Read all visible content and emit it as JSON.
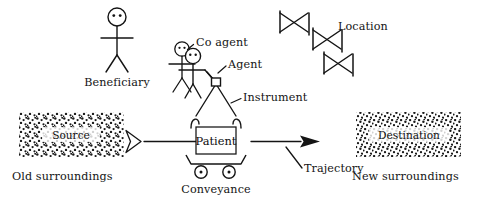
{
  "figure": {
    "background_color": "#ffffff",
    "ink_color": "#141414",
    "width": 477,
    "height": 203
  },
  "labels": {
    "beneficiary": "Beneficiary",
    "co_agent": "Co agent",
    "agent": "Agent",
    "instrument": "Instrument",
    "location": "Location",
    "source": "Source",
    "destination": "Destination",
    "patient": "Patient",
    "conveyance": "Conveyance",
    "trajectory": "Trajectory",
    "old_surroundings": "Old surroundings",
    "new_surroundings": "New surroundings"
  },
  "elements": {
    "beneficiary_figure": "stick-figure-icon",
    "co_agent_figure": "stick-figure-icon",
    "agent_figure": "stick-figure-icon",
    "instrument_icon": "small-square-hook-icon",
    "location_icon": "bowtie-chain-icon",
    "source_block": "stippled-rectangle-icon",
    "destination_block": "stippled-rectangle-icon",
    "patient_box": "rectangle-icon",
    "conveyance_icon": "cart-with-wheels-icon",
    "trajectory_start": "hollow-chevron-arrow-icon",
    "trajectory_end": "solid-arrowhead-icon",
    "sling_icon": "triangle-sling-icon"
  }
}
